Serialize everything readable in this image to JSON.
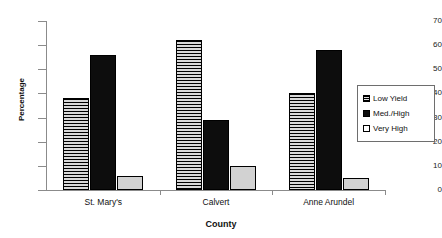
{
  "chart_data": {
    "type": "bar",
    "title": "",
    "xlabel": "County",
    "ylabel": "Percentage",
    "categories": [
      "St. Mary's",
      "Calvert",
      "Anne Arundel"
    ],
    "series": [
      {
        "name": "Low Yield",
        "values": [
          38,
          62,
          40
        ],
        "fill": "horizontal-hatch",
        "color": "#cccccc"
      },
      {
        "name": "Med./High",
        "values": [
          56,
          29,
          58
        ],
        "fill": "solid",
        "color": "#0d0d0d"
      },
      {
        "name": "Very High",
        "values": [
          6,
          10,
          5
        ],
        "fill": "solid-light",
        "color": "#d2d2d2"
      }
    ],
    "ylim": [
      0,
      70
    ],
    "yticks": [
      0,
      10,
      20,
      30,
      40,
      50,
      60,
      70
    ],
    "ytick_labels": [
      "0",
      "10",
      "20",
      "30",
      "40",
      "50",
      "60",
      "70"
    ],
    "grid": false,
    "legend_position": "right"
  },
  "legend": {
    "items": [
      {
        "label": "Low Yield"
      },
      {
        "label": "Med./High"
      },
      {
        "label": "Very High"
      }
    ]
  }
}
